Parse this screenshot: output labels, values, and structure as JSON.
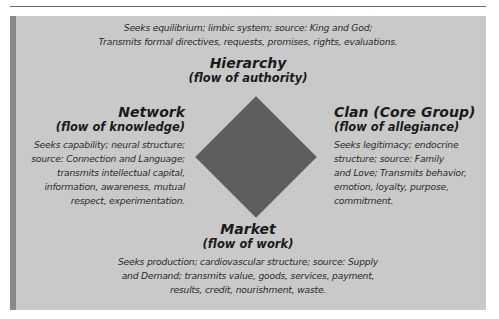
{
  "diagram": {
    "center_shape": "diamond",
    "colors": {
      "panel": "#c9c9c9",
      "accent_bar": "#8a8a8a",
      "diamond": "#5e5e5e",
      "text": "#1e1e1e"
    },
    "top": {
      "desc_lines": [
        "Seeks equilibrium; limbic system; source: King and God;",
        "Transmits formal directives, requests, promises, rights, evaluations."
      ],
      "title": "Hierarchy",
      "subtitle": "(flow of authority)"
    },
    "left": {
      "title": "Network",
      "subtitle": "(flow of knowledge)",
      "desc_lines": [
        "Seeks capability; neural structure;",
        "source: Connection and Language;",
        "transmits intellectual capital,",
        "information, awareness, mutual",
        "respect, experimentation."
      ]
    },
    "right": {
      "title": "Clan (Core Group)",
      "subtitle": "(flow of allegiance)",
      "desc_lines": [
        "Seeks legitimacy; endocrine",
        "structure; source: Family",
        "and Love; Transmits behavior,",
        "emotion, loyalty, purpose,",
        "commitment."
      ]
    },
    "bottom": {
      "title": "Market",
      "subtitle": "(flow of work)",
      "desc_lines": [
        "Seeks production; cardiovascular structure; source: Supply",
        "and Demand; transmits value, goods, services, payment,",
        "results, credit, nourishment, waste."
      ]
    }
  }
}
